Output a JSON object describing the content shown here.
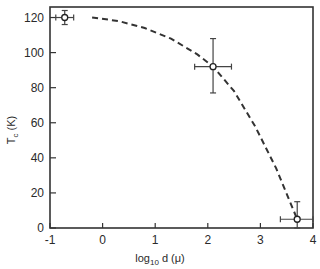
{
  "chart_data": {
    "type": "scatter",
    "title": "",
    "xlabel": "log10 d (μ)",
    "xlabel_parts": {
      "base": "log",
      "sub": "10",
      "rest": " d (μ)"
    },
    "ylabel": "Tc (K)",
    "ylabel_parts": {
      "base": "T",
      "sub": "c",
      "rest": " (K)"
    },
    "xlim": [
      -1,
      4
    ],
    "ylim": [
      0,
      130
    ],
    "x_ticks": [
      -1,
      0,
      1,
      2,
      3,
      4
    ],
    "x_tick_labels": [
      "-1",
      "0",
      "1",
      "2",
      "3",
      "4"
    ],
    "y_ticks": [
      0,
      20,
      40,
      60,
      80,
      100,
      120
    ],
    "y_tick_labels": [
      "0",
      "20",
      "40",
      "60",
      "80",
      "100",
      "120"
    ],
    "grid": false,
    "legend": null,
    "series": [
      {
        "name": "measured",
        "marker": "open-circle",
        "points": [
          {
            "x": -0.72,
            "y": 120,
            "xerr": 0.17,
            "yerr_plus": 4,
            "yerr_minus": 4
          },
          {
            "x": 2.1,
            "y": 92,
            "xerr": 0.35,
            "yerr_plus": 16,
            "yerr_minus": 15
          },
          {
            "x": 3.7,
            "y": 5,
            "xerr": 0.32,
            "yerr_plus": 10,
            "yerr_minus": 5
          }
        ]
      },
      {
        "name": "fit",
        "style": "dashed",
        "x": [
          -0.2,
          0.3,
          0.8,
          1.3,
          1.8,
          2.1,
          2.5,
          2.9,
          3.3,
          3.7
        ],
        "y": [
          120,
          118,
          114,
          108,
          99,
          92,
          78,
          58,
          34,
          5
        ]
      }
    ]
  }
}
